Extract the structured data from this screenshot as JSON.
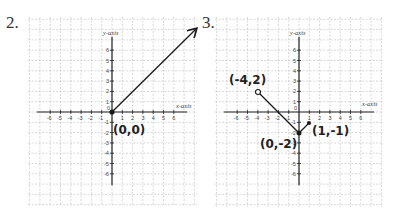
{
  "problems": [
    {
      "number": "2.",
      "x_axis_label": "x-axis",
      "y_axis_label": "y-axis"
    },
    {
      "number": "3.",
      "x_axis_label": "x-axis",
      "y_axis_label": "y-axis"
    }
  ],
  "annotations": {
    "p2_origin": "(0,0)",
    "p3_start": "(-4,2)",
    "p3_vertex": "(0,-2)",
    "p3_end": "(1,-1)"
  },
  "ticks": {
    "x_neg": [
      "-6",
      "-5",
      "-4",
      "-3",
      "-2",
      "-1"
    ],
    "x_pos": [
      "1",
      "2",
      "3",
      "4",
      "5",
      "6"
    ],
    "y_pos": [
      "1",
      "2",
      "3",
      "4",
      "5",
      "6"
    ],
    "y_neg": [
      "-1",
      "-2",
      "-3",
      "-4",
      "-5",
      "-6"
    ],
    "zero": "0"
  },
  "colors": {
    "grid": "#bdbdbd",
    "axis": "#222222",
    "ink": "#1a1a1a"
  },
  "chart_data": [
    {
      "type": "line",
      "title": "2.",
      "xlabel": "x-axis",
      "ylabel": "y-axis",
      "xlim": [
        -7,
        7
      ],
      "ylim": [
        -7,
        7
      ],
      "grid": true,
      "series": [
        {
          "name": "ray",
          "points": [
            [
              0,
              0
            ],
            [
              8.5,
              8.3
            ]
          ],
          "start": "closed",
          "end": "arrow"
        }
      ],
      "annotations": [
        "(0,0)"
      ]
    },
    {
      "type": "line",
      "title": "3.",
      "xlabel": "x-axis",
      "ylabel": "y-axis",
      "xlim": [
        -7,
        7
      ],
      "ylim": [
        -7,
        7
      ],
      "grid": true,
      "series": [
        {
          "name": "piecewise",
          "points": [
            [
              -4,
              2
            ],
            [
              0,
              -2
            ],
            [
              1,
              -1
            ]
          ],
          "start": "open",
          "end": "closed"
        }
      ],
      "annotations": [
        "(-4,2)",
        "(0,-2)",
        "(1,-1)"
      ]
    }
  ]
}
